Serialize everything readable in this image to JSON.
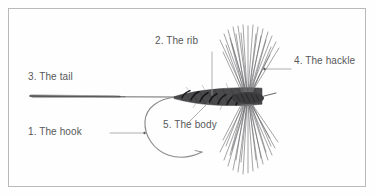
{
  "figure": {
    "background_color": "#fefefe",
    "border_color": "#b8b8b8",
    "label_color": "#58585a",
    "ink_color": "#3a3a3a",
    "labels": [
      {
        "id": "hook",
        "text": "1. The hook",
        "part": "hook"
      },
      {
        "id": "rib",
        "text": "2. The rib",
        "part": "rib"
      },
      {
        "id": "tail",
        "text": "3. The tail",
        "part": "tail"
      },
      {
        "id": "hackle",
        "text": "4. The hackle",
        "part": "hackle"
      },
      {
        "id": "body",
        "text": "5. The body",
        "part": "body"
      }
    ]
  }
}
